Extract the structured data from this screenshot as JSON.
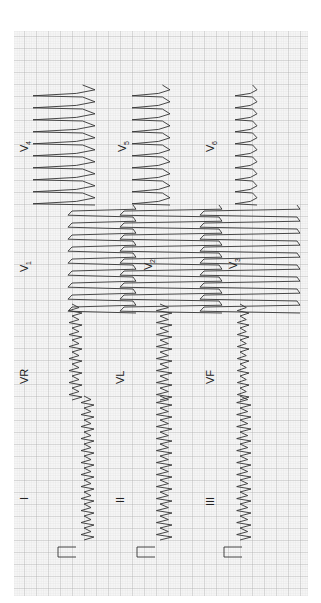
{
  "figure": {
    "type": "12-lead electrocardiogram",
    "orientation": "rotated 90 degrees counter-clockwise",
    "paper": {
      "grid_color_minor": "#d4d4d4",
      "grid_color_major": "#9a9a9a",
      "background": "#f7f7f7",
      "trace_color": "#333333",
      "bounds": {
        "x": 14,
        "y": 31,
        "width": 294,
        "height": 565
      }
    },
    "columns": [
      {
        "name": "row-1",
        "leads": [
          "I",
          "VR",
          "V1",
          "V4"
        ]
      },
      {
        "name": "row-2",
        "leads": [
          "II",
          "VL",
          "V2",
          "V5"
        ]
      },
      {
        "name": "row-3",
        "leads": [
          "III",
          "VF",
          "V3",
          "V6"
        ]
      }
    ]
  },
  "labels": {
    "I": {
      "text": "I",
      "x": 24,
      "y": 497
    },
    "II": {
      "text": "II",
      "x": 120,
      "y": 497
    },
    "III": {
      "text": "III",
      "x": 210,
      "y": 497
    },
    "VR": {
      "text": "VR",
      "x": 24,
      "y": 375
    },
    "VL": {
      "text": "VL",
      "x": 120,
      "y": 375
    },
    "VF": {
      "text": "VF",
      "x": 210,
      "y": 375
    },
    "V1": {
      "text": "V",
      "sub": "1",
      "x": 24,
      "y": 265
    },
    "V2": {
      "text": "V",
      "sub": "2",
      "x": 148,
      "y": 263
    },
    "V3": {
      "text": "V",
      "sub": "3",
      "x": 233,
      "y": 262
    },
    "V4": {
      "text": "V",
      "sub": "4",
      "x": 24,
      "y": 145
    },
    "V5": {
      "text": "V",
      "sub": "5",
      "x": 122,
      "y": 145
    },
    "V6": {
      "text": "V",
      "sub": "6",
      "x": 210,
      "y": 145
    }
  }
}
